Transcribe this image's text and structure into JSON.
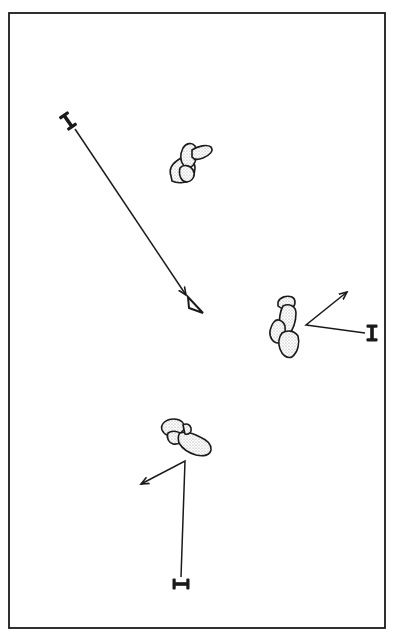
{
  "diagram": {
    "type": "schematic-plan",
    "frame": {
      "x": 9,
      "y": 13,
      "width": 376,
      "height": 615,
      "stroke": "#1a1a1a"
    },
    "colors": {
      "ink": "#1a1a1a",
      "stipple": "#9a9a9a",
      "background": "#ffffff"
    },
    "labels": [
      {
        "id": "label-top-left",
        "text": "I",
        "x": 68,
        "y": 121,
        "rotate": -35
      },
      {
        "id": "label-right",
        "text": "I",
        "x": 372,
        "y": 333,
        "rotate": 0
      },
      {
        "id": "label-bottom",
        "text": "I",
        "x": 181,
        "y": 584,
        "rotate": 90
      }
    ],
    "marker": {
      "id": "triangle-marker",
      "shape": "open-triangle",
      "x": 197,
      "y": 305
    },
    "clusters": [
      {
        "id": "cluster-top",
        "cx": 190,
        "cy": 163
      },
      {
        "id": "cluster-right",
        "cx": 284,
        "cy": 325
      },
      {
        "id": "cluster-bottom",
        "cx": 188,
        "cy": 440
      }
    ],
    "arrows": [
      {
        "id": "arrow-top-left",
        "from": [
          75,
          129
        ],
        "to": [
          186,
          295
        ],
        "vertex": null
      },
      {
        "id": "arrow-right",
        "from": [
          365,
          330
        ],
        "vertex": [
          306,
          325
        ],
        "to": [
          347,
          292
        ]
      },
      {
        "id": "arrow-bottom",
        "from": [
          181,
          577
        ],
        "vertex": [
          185,
          461
        ],
        "to": [
          141,
          484
        ]
      }
    ]
  }
}
